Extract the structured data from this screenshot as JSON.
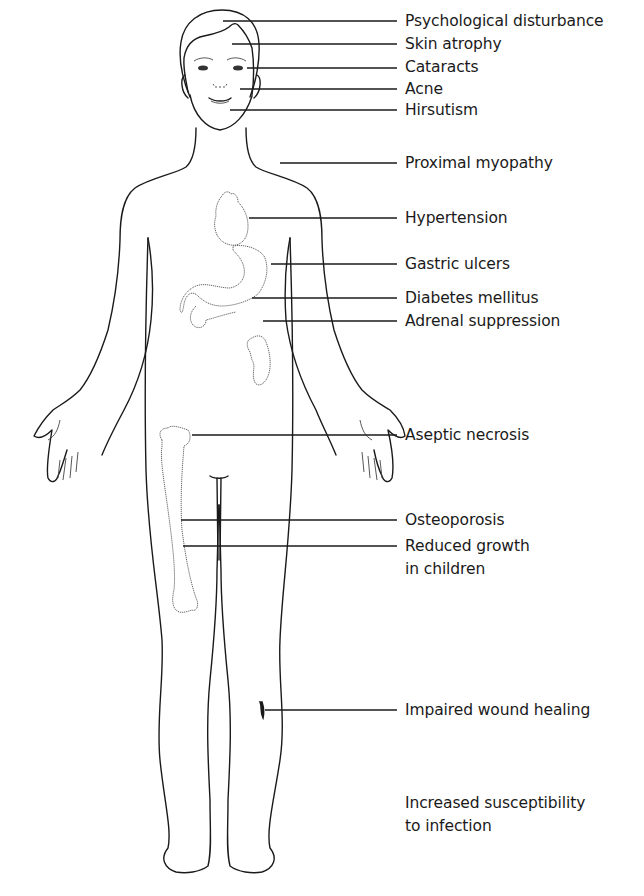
{
  "figure": {
    "labels": [
      {
        "id": "psychological-disturbance",
        "text": "Psychological disturbance",
        "y": 21,
        "line_y": 21,
        "x1": 223
      },
      {
        "id": "skin-atrophy",
        "text": "Skin atrophy",
        "y": 44,
        "line_y": 44,
        "x1": 232
      },
      {
        "id": "cataracts",
        "text": "Cataracts",
        "y": 67,
        "line_y": 68,
        "x1": 247
      },
      {
        "id": "acne",
        "text": "Acne",
        "y": 89,
        "line_y": 89,
        "x1": 240
      },
      {
        "id": "hirsutism",
        "text": "Hirsutism",
        "y": 110,
        "line_y": 110,
        "x1": 230
      },
      {
        "id": "proximal-myopathy",
        "text": "Proximal myopathy",
        "y": 163,
        "line_y": 163,
        "x1": 280
      },
      {
        "id": "hypertension",
        "text": "Hypertension",
        "y": 218,
        "line_y": 218,
        "x1": 249
      },
      {
        "id": "gastric-ulcers",
        "text": "Gastric ulcers",
        "y": 264,
        "line_y": 264,
        "x1": 271
      },
      {
        "id": "diabetes-mellitus",
        "text": "Diabetes mellitus",
        "y": 298,
        "line_y": 298,
        "x1": 252
      },
      {
        "id": "adrenal-suppression",
        "text": "Adrenal suppression",
        "y": 321,
        "line_y": 321,
        "x1": 263
      },
      {
        "id": "aseptic-necrosis",
        "text": "Aseptic necrosis",
        "y": 435,
        "line_y": 435,
        "x1": 192
      },
      {
        "id": "osteoporosis",
        "text": "Osteoporosis",
        "y": 520,
        "line_y": 520,
        "x1": 181
      },
      {
        "id": "reduced-growth",
        "text": "Reduced growth",
        "text2": "in children",
        "y": 546,
        "line_y": 546,
        "x1": 183
      },
      {
        "id": "impaired-wound-healing",
        "text": "Impaired wound healing",
        "y": 710,
        "line_y": 710,
        "x1": 265
      },
      {
        "id": "increased-susceptibility",
        "text": "Increased susceptibility",
        "text2": "to infection",
        "y": 803,
        "line_y": null,
        "x1": null
      }
    ],
    "line_end_x": 397,
    "colors": {
      "ink": "#1a1a1a",
      "background": "#ffffff",
      "organ_stroke": "#555555"
    }
  }
}
